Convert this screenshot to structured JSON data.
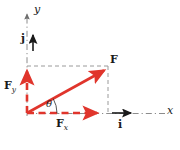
{
  "figure": {
    "type": "vector-decomposition-diagram",
    "background_color": "#ffffff",
    "colors": {
      "vector_red": "#e0352c",
      "axis_gray": "#8c8c8c",
      "label_black": "#1a1a1a"
    }
  },
  "axes": {
    "x_label": "x",
    "y_label": "y",
    "origin": {
      "x": 27,
      "y": 113
    },
    "x_axis": {
      "from_x": 27,
      "to_x": 165,
      "y": 113,
      "style": "dash-dot",
      "arrow": false
    },
    "y_axis": {
      "x": 27,
      "from_y": 113,
      "to_y": 12,
      "style": "dash-dot",
      "arrow": true
    }
  },
  "unit_vectors": [
    {
      "name": "i",
      "label": "i",
      "description": "unit vector along x-axis",
      "color": "#1a1a1a",
      "from": {
        "x": 113,
        "y": 113
      },
      "to": {
        "x": 136,
        "y": 113
      },
      "label_pos": {
        "x": 122,
        "y": 120
      }
    },
    {
      "name": "j",
      "label": "j",
      "description": "unit vector along y-axis",
      "color": "#1a1a1a",
      "from": {
        "x": 33,
        "y": 51
      },
      "to": {
        "x": 33,
        "y": 31
      },
      "label_pos": {
        "x": 22,
        "y": 38
      }
    }
  ],
  "vectors": [
    {
      "name": "F",
      "label": "F",
      "subscript": "",
      "description": "resultant force vector",
      "color": "#e0352c",
      "style": "solid",
      "from": {
        "x": 27,
        "y": 113
      },
      "to": {
        "x": 109,
        "y": 68
      },
      "label_pos": {
        "x": 112,
        "y": 58
      }
    },
    {
      "name": "Fx",
      "label": "F",
      "subscript": "x",
      "description": "x-component of F",
      "color": "#e0352c",
      "style": "dashed",
      "from": {
        "x": 27,
        "y": 113
      },
      "to": {
        "x": 102,
        "y": 113
      },
      "label_pos": {
        "x": 57,
        "y": 120
      }
    },
    {
      "name": "Fy",
      "label": "F",
      "subscript": "y",
      "description": "y-component of F",
      "color": "#e0352c",
      "style": "dashed",
      "from": {
        "x": 27,
        "y": 113
      },
      "to": {
        "x": 27,
        "y": 66
      },
      "label_pos": {
        "x": 5,
        "y": 83
      }
    }
  ],
  "angle": {
    "symbol": "θ",
    "description": "angle between F and x-axis",
    "vertex": {
      "x": 27,
      "y": 113
    },
    "value_degrees": 29,
    "label_pos": {
      "x": 47,
      "y": 101
    }
  },
  "projection_lines": [
    {
      "name": "horizontal-projection",
      "description": "dashed line from Fy tip to F tip",
      "from": {
        "x": 27,
        "y": 66
      },
      "to": {
        "x": 108,
        "y": 66
      },
      "color": "#8c8c8c",
      "style": "dashed"
    },
    {
      "name": "vertical-projection",
      "description": "dashed line from Fx tip to F tip",
      "from": {
        "x": 108,
        "y": 66
      },
      "to": {
        "x": 108,
        "y": 114
      },
      "color": "#8c8c8c",
      "style": "dashed"
    }
  ]
}
